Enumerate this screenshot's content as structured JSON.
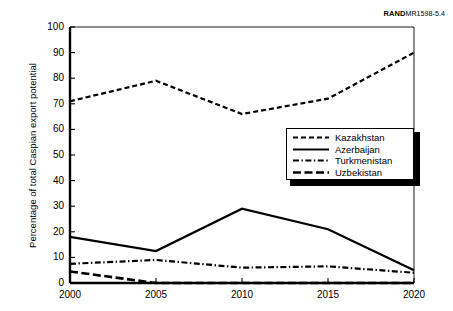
{
  "figure": {
    "source_id_mark": "RAND",
    "source_id_number": "MR1598-5.4"
  },
  "axes": {
    "y_title": "Percentage of total Caspian export potential",
    "y_ticks": [
      "0",
      "10",
      "20",
      "30",
      "40",
      "50",
      "60",
      "70",
      "80",
      "90",
      "100"
    ],
    "x_ticks": [
      "2000",
      "2005",
      "2010",
      "2015",
      "2020"
    ]
  },
  "legend": {
    "items": [
      {
        "label": "Kazakhstan",
        "dash": "5,3",
        "width": 2.2
      },
      {
        "label": "Azerbaijan",
        "dash": "none",
        "width": 2.2
      },
      {
        "label": "Turkmenistan",
        "dash": "6,2.5,1.4,2.5",
        "width": 2.2
      },
      {
        "label": "Uzbekistan",
        "dash": "8,3.5",
        "width": 2.6
      }
    ]
  },
  "chart_data": {
    "type": "line",
    "title": "",
    "subtitle": "",
    "xlabel": "",
    "ylabel": "Percentage of total Caspian export potential",
    "x": [
      2000,
      2005,
      2010,
      2015,
      2020
    ],
    "xtick_labels": [
      "2000",
      "2005",
      "2010",
      "2015",
      "2020"
    ],
    "xlim": [
      2000,
      2020
    ],
    "ylim": [
      0,
      100
    ],
    "ytick_labels": [
      "0",
      "10",
      "20",
      "30",
      "40",
      "50",
      "60",
      "70",
      "80",
      "90",
      "100"
    ],
    "ytick_step": 10,
    "grid": false,
    "legend_position": "center-right",
    "series": [
      {
        "name": "Kazakhstan",
        "values": [
          71,
          79,
          66,
          72,
          90
        ],
        "style": "short-dash",
        "dash": "5,3",
        "width": 2.2,
        "color": "#000000"
      },
      {
        "name": "Azerbaijan",
        "values": [
          18,
          12.5,
          29,
          21,
          5
        ],
        "style": "solid",
        "dash": "none",
        "width": 2.2,
        "color": "#000000"
      },
      {
        "name": "Turkmenistan",
        "values": [
          7.5,
          9,
          6,
          6.5,
          4
        ],
        "style": "dash-dot",
        "dash": "6,2.5,1.4,2.5",
        "width": 2.2,
        "color": "#000000"
      },
      {
        "name": "Uzbekistan",
        "values": [
          4.5,
          0,
          0,
          0,
          0
        ],
        "style": "long-dash",
        "dash": "8,3.5",
        "width": 2.6,
        "color": "#000000"
      }
    ]
  },
  "geometry": {
    "plot_left": 70,
    "plot_right": 414,
    "plot_top": 27,
    "plot_bottom": 283
  }
}
